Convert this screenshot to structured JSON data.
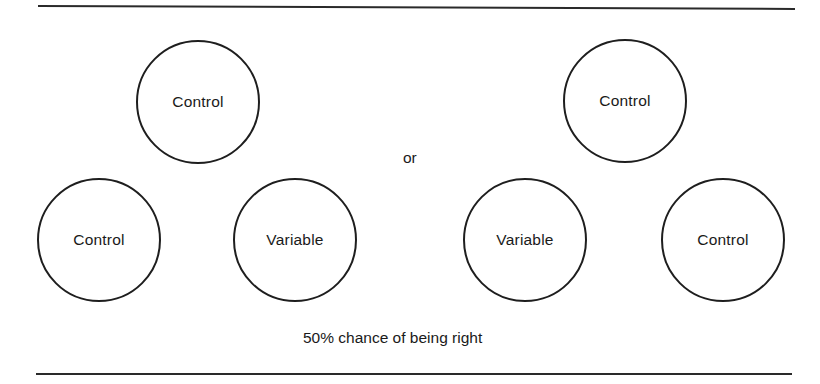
{
  "figure": {
    "left_group": {
      "top": "Control",
      "bottom_left": "Control",
      "bottom_right": "Variable"
    },
    "separator": "or",
    "right_group": {
      "top": "Control",
      "bottom_left": "Variable",
      "bottom_right": "Control"
    },
    "caption": "50% chance of being right"
  },
  "colors": {
    "stroke": "#1e1e1e",
    "background": "#ffffff"
  }
}
